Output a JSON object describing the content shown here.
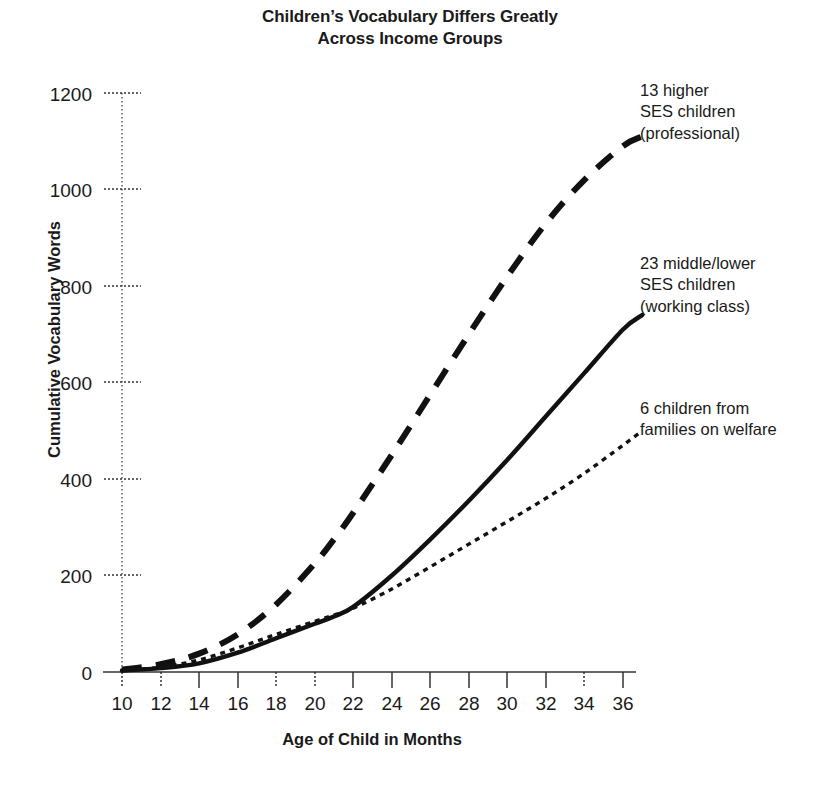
{
  "chart_data": {
    "type": "line",
    "title": "Children’s Vocabulary Differs Greatly\nAcross Income Groups",
    "xlabel": "Age of Child in Months",
    "ylabel": "Cumulative Vocabulary Words",
    "xlim": [
      10,
      37
    ],
    "ylim": [
      0,
      1200
    ],
    "grid": false,
    "legend_position": "right-inline-annotations",
    "x_ticks": [
      10,
      12,
      14,
      16,
      18,
      20,
      22,
      24,
      26,
      28,
      30,
      32,
      34,
      36
    ],
    "y_ticks": [
      0,
      200,
      400,
      600,
      800,
      1000,
      1200
    ],
    "x": [
      10,
      12,
      14,
      16,
      18,
      20,
      21,
      22,
      24,
      26,
      28,
      30,
      32,
      34,
      36,
      37
    ],
    "series": [
      {
        "name": "13 higher SES children (professional)",
        "label": "13 higher\nSES children\n(professional)",
        "style": "dashed",
        "color": "#111111",
        "values": [
          5,
          16,
          38,
          78,
          140,
          225,
          275,
          330,
          450,
          575,
          700,
          820,
          930,
          1020,
          1090,
          1110
        ]
      },
      {
        "name": "23 middle/lower SES children (working class)",
        "label": "23 middle/lower\nSES children\n(working class)",
        "style": "solid",
        "color": "#111111",
        "values": [
          3,
          8,
          18,
          40,
          70,
          100,
          115,
          135,
          200,
          275,
          355,
          440,
          530,
          620,
          710,
          740
        ]
      },
      {
        "name": "6 children from families on welfare",
        "label": "6 children from\nfamilies on welfare",
        "style": "dotted",
        "color": "#111111",
        "values": [
          3,
          10,
          25,
          50,
          78,
          105,
          118,
          132,
          172,
          218,
          265,
          312,
          360,
          412,
          470,
          500
        ]
      }
    ],
    "annotations": [
      {
        "text": "13 higher\nSES children\n(professional)",
        "anchor_series": 0
      },
      {
        "text": "23 middle/lower\nSES children\n(working class)",
        "anchor_series": 1
      },
      {
        "text": "6 children from\nfamilies on welfare",
        "anchor_series": 2
      }
    ]
  },
  "axis": {
    "y_tick_labels": [
      "1200",
      "1000",
      "800",
      "600",
      "400",
      "200",
      "0"
    ],
    "x_tick_labels": [
      "10",
      "12",
      "14",
      "16",
      "18",
      "20",
      "22",
      "24",
      "26",
      "28",
      "30",
      "32",
      "34",
      "36"
    ]
  },
  "colors": {
    "background": "#ffffff",
    "ink": "#111111",
    "axis": "#555555"
  }
}
